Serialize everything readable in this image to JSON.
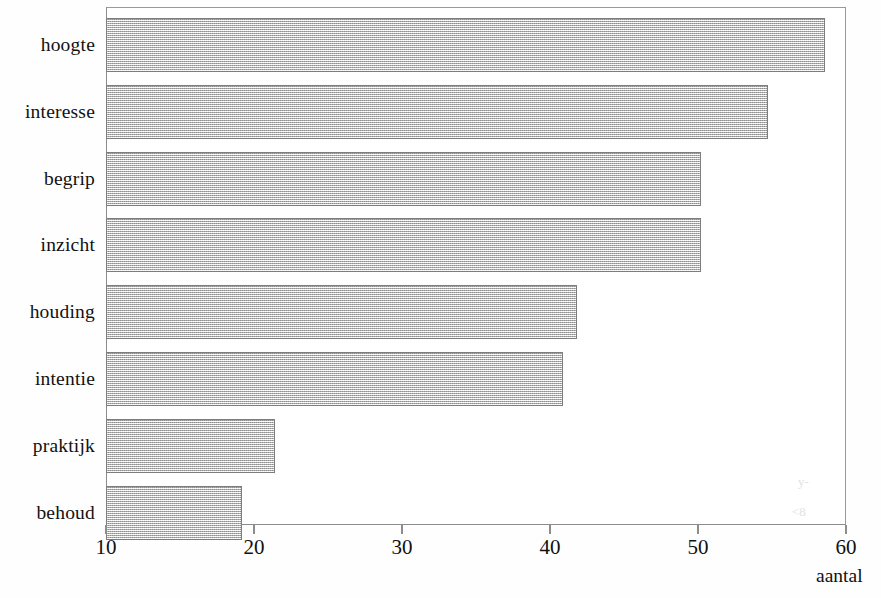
{
  "chart_data": {
    "type": "bar",
    "orientation": "horizontal",
    "title": "",
    "subtitle": "",
    "xlabel": "aantal",
    "ylabel": "",
    "xlim": [
      10,
      60
    ],
    "xticks": [
      10,
      20,
      30,
      40,
      50,
      60
    ],
    "xtick_labels": [
      "10",
      "20",
      "30",
      "40",
      "50",
      "60"
    ],
    "grid": false,
    "legend": null,
    "categories": [
      "hoogte",
      "interesse",
      "begrip",
      "inzicht",
      "houding",
      "intentie",
      "praktijk",
      "behoud"
    ],
    "values": [
      58.6,
      54.7,
      50.2,
      50.2,
      41.8,
      40.9,
      21.4,
      19.2
    ],
    "bars": [
      {
        "category": "hoogte",
        "value": 58.6
      },
      {
        "category": "interesse",
        "value": 54.7
      },
      {
        "category": "begrip",
        "value": 50.2
      },
      {
        "category": "inzicht",
        "value": 50.2
      },
      {
        "category": "houding",
        "value": 41.8
      },
      {
        "category": "intentie",
        "value": 40.9
      },
      {
        "category": "praktijk",
        "value": 21.4
      },
      {
        "category": "behoud",
        "value": 19.2
      }
    ],
    "colors": {
      "bar_fill": "#cdcdcd",
      "bar_border": "#7d7d7d",
      "axis": "#8c8c8c",
      "text": "#111111",
      "background": "#ffffff"
    },
    "artifacts": [
      "scan-smudge",
      "scan-smudge"
    ]
  }
}
